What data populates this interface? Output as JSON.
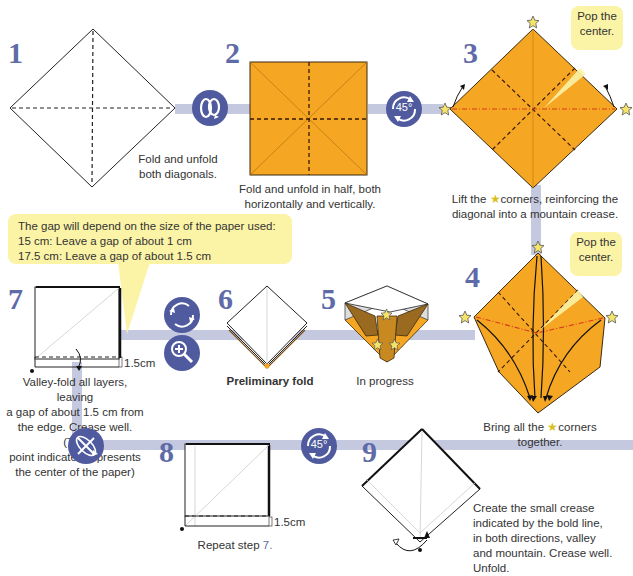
{
  "steps": [
    {
      "number": "1",
      "caption": [
        "Fold and unfold",
        "both diagonals."
      ]
    },
    {
      "number": "2",
      "caption": [
        "Fold and unfold in half, both",
        "horizontally and vertically."
      ]
    },
    {
      "number": "3",
      "caption_pre": "Lift the",
      "caption_post": "corners, reinforcing the",
      "caption_line2": "diagonal into a mountain crease.",
      "callout": [
        "Pop the",
        "center."
      ]
    },
    {
      "number": "4",
      "caption_pre": "Bring all the",
      "caption_post": "corners",
      "caption_line2": "together.",
      "callout": [
        "Pop the",
        "center."
      ]
    },
    {
      "number": "5",
      "caption": "In progress"
    },
    {
      "number": "6",
      "caption": "Preliminary fold"
    },
    {
      "number": "7",
      "caption": [
        "Valley-fold all layers, leaving",
        "a gap of about 1.5 cm from",
        "the edge. Crease well. (The",
        "point indicated represents",
        "the center of the paper)"
      ],
      "measure": "1.5cm"
    },
    {
      "number": "8",
      "caption_pre": "Repeat step",
      "caption_ref": "7.",
      "measure": "1.5cm"
    },
    {
      "number": "9",
      "caption": [
        "Create the small crease",
        "indicated by the bold line,",
        "in both directions, valley",
        "and mountain. Crease well.",
        "Unfold."
      ]
    }
  ],
  "note": {
    "lines": [
      "The gap will depend on the size of the paper used:",
      "15 cm: Leave a gap of about 1 cm",
      "17.5 cm: Leave a gap of about 1.5 cm"
    ]
  },
  "symbols": {
    "turn_over": "turn-over-icon",
    "rotate_45": "45°",
    "rotate_45_b": "45°"
  },
  "colors": {
    "paper_orange": "#f5a623",
    "step_number_blue": "#5f6ba8",
    "connector": "#c5c9e0",
    "icon_circle": "#4f5b9e",
    "callout_yellow": "#fbf3a6",
    "mountain_red": "#d9381e"
  }
}
